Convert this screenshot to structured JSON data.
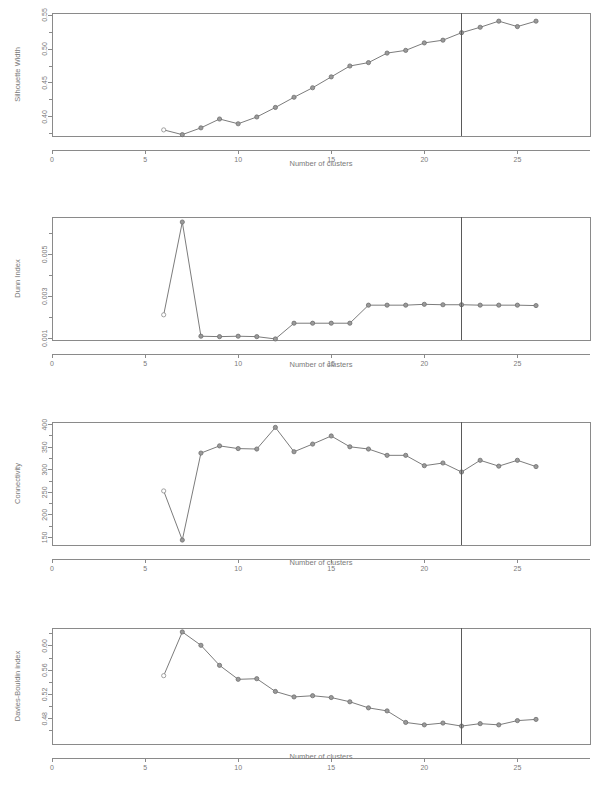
{
  "figure": {
    "panel_count": 4,
    "shared_xlabel": "Number of clusters",
    "vline_label": "22",
    "line_color": "#7c7c7c",
    "marker_color": "#9a9a9a",
    "axis_color": "#8a8a8a",
    "vline_color": "#5a5a5a",
    "background": "#ffffff"
  },
  "chart_data": [
    {
      "type": "line",
      "title": "",
      "xlabel": "Number of clusters",
      "ylabel": "Silhouette Width",
      "xlim": [
        0,
        28.9
      ],
      "ylim": [
        0.372,
        0.553
      ],
      "xticks": [
        0,
        5,
        10,
        15,
        20,
        25
      ],
      "xticklabels": [
        "0",
        "5",
        "10",
        "15",
        "20",
        "25"
      ],
      "yticks": [
        0.4,
        0.45,
        0.5,
        0.55
      ],
      "yticklabels": [
        "0.40",
        "0.45",
        "0.50",
        "0.55"
      ],
      "grid": false,
      "legend": "none",
      "vline_x": 22,
      "x": [
        6,
        7,
        8,
        9,
        10,
        11,
        12,
        13,
        14,
        15,
        16,
        17,
        18,
        19,
        20,
        21,
        22,
        23,
        24,
        25,
        26
      ],
      "values": [
        0.381,
        0.374,
        0.384,
        0.397,
        0.39,
        0.4,
        0.414,
        0.429,
        0.443,
        0.459,
        0.475,
        0.48,
        0.494,
        0.498,
        0.509,
        0.513,
        0.524,
        0.532,
        0.541,
        0.533,
        0.541
      ]
    },
    {
      "type": "line",
      "title": "",
      "xlabel": "Number of clusters",
      "ylabel": "Dunn Index",
      "xlim": [
        0,
        28.9
      ],
      "ylim": [
        0.00092,
        0.00678
      ],
      "xticks": [
        0,
        5,
        10,
        15,
        20,
        25
      ],
      "xticklabels": [
        "0",
        "5",
        "10",
        "15",
        "20",
        "25"
      ],
      "yticks": [
        0.001,
        0.003,
        0.005
      ],
      "yticklabels": [
        "0.001",
        "0.003",
        "0.005"
      ],
      "grid": false,
      "legend": "none",
      "vline_x": 22,
      "x": [
        6,
        7,
        8,
        9,
        10,
        11,
        12,
        13,
        14,
        15,
        16,
        17,
        18,
        19,
        20,
        21,
        22,
        23,
        24,
        25,
        26
      ],
      "values": [
        0.00212,
        0.00654,
        0.0011,
        0.00108,
        0.0011,
        0.00108,
        0.00097,
        0.00172,
        0.00172,
        0.00172,
        0.00172,
        0.00258,
        0.00258,
        0.00258,
        0.00262,
        0.0026,
        0.0026,
        0.00258,
        0.00258,
        0.00258,
        0.00256
      ]
    },
    {
      "type": "line",
      "title": "",
      "xlabel": "Number of clusters",
      "ylabel": "Connectivity",
      "xlim": [
        0,
        28.9
      ],
      "ylim": [
        133,
        406
      ],
      "xticks": [
        0,
        5,
        10,
        15,
        20,
        25
      ],
      "xticklabels": [
        "0",
        "5",
        "10",
        "15",
        "20",
        "25"
      ],
      "yticks": [
        150,
        200,
        250,
        300,
        350,
        400
      ],
      "yticklabels": [
        "150",
        "200",
        "250",
        "300",
        "350",
        "400"
      ],
      "grid": false,
      "legend": "none",
      "vline_x": 22,
      "x": [
        6,
        7,
        8,
        9,
        10,
        11,
        12,
        13,
        14,
        15,
        16,
        17,
        18,
        19,
        20,
        21,
        22,
        23,
        24,
        25,
        26
      ],
      "values": [
        253,
        144,
        337,
        353,
        347,
        346,
        394,
        340,
        357,
        375,
        351,
        346,
        332,
        332,
        309,
        315,
        295,
        321,
        308,
        321,
        307
      ]
    },
    {
      "type": "line",
      "title": "",
      "xlabel": "Number of clusters",
      "ylabel": "Davies-Bouldin index",
      "xlim": [
        0,
        28.9
      ],
      "ylim": [
        0.4385,
        0.6295
      ],
      "xticks": [
        0,
        5,
        10,
        15,
        20,
        25
      ],
      "xticklabels": [
        "0",
        "5",
        "10",
        "15",
        "20",
        "25"
      ],
      "yticks": [
        0.48,
        0.52,
        0.56,
        0.6
      ],
      "yticklabels": [
        "0.48",
        "0.52",
        "0.56",
        "0.60"
      ],
      "grid": false,
      "legend": "none",
      "vline_x": 22,
      "x": [
        6,
        7,
        8,
        9,
        10,
        11,
        12,
        13,
        14,
        15,
        16,
        17,
        18,
        19,
        20,
        21,
        22,
        23,
        24,
        25,
        26
      ],
      "values": [
        0.551,
        0.623,
        0.601,
        0.568,
        0.545,
        0.546,
        0.525,
        0.516,
        0.518,
        0.515,
        0.508,
        0.498,
        0.493,
        0.474,
        0.47,
        0.473,
        0.468,
        0.472,
        0.47,
        0.477,
        0.479
      ]
    }
  ]
}
